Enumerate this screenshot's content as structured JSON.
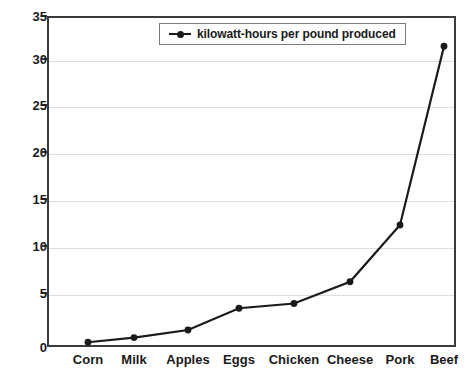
{
  "chart_data": {
    "type": "line",
    "title": "",
    "xlabel": "",
    "ylabel": "",
    "categories": [
      "Corn",
      "Milk",
      "Apples",
      "Eggs",
      "Chicken",
      "Cheese",
      "Pork",
      "Beef"
    ],
    "series": [
      {
        "name": "kilowatt-hours per pound produced",
        "values": [
          0.5,
          1.0,
          1.8,
          4.1,
          4.6,
          6.9,
          12.9,
          31.8
        ]
      }
    ],
    "ylim": [
      0,
      35
    ],
    "ytick_values": [
      0,
      5,
      10,
      15,
      20,
      25,
      30,
      35
    ],
    "ytick_labels": [
      "0",
      "5",
      "10",
      "15",
      "20",
      "25",
      "30",
      "35"
    ],
    "grid": true,
    "legend_position": "top-center",
    "line_color": "#1a1a1a",
    "marker_color": "#1a1a1a",
    "grid_color": "#dededc",
    "axis_color": "#3b3b3b"
  },
  "legend": {
    "entries": [
      {
        "label": "kilowatt-hours per pound produced"
      }
    ]
  }
}
